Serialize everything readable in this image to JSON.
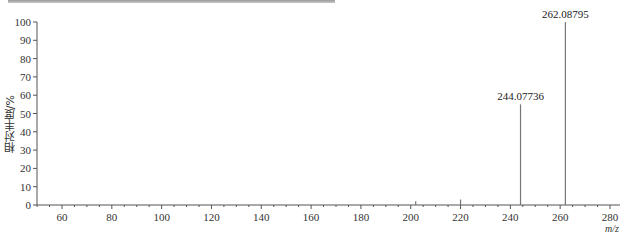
{
  "chart_data": {
    "type": "bar",
    "subtype": "mass-spectrum-stick",
    "title": "",
    "xlabel": "m/z",
    "ylabel": "相对丰度/%",
    "xlim": [
      50,
      284
    ],
    "ylim": [
      0,
      100
    ],
    "x_ticks": [
      60,
      80,
      100,
      120,
      140,
      160,
      180,
      200,
      220,
      240,
      260,
      280
    ],
    "y_ticks": [
      0,
      10,
      20,
      30,
      40,
      50,
      60,
      70,
      80,
      90,
      100
    ],
    "grid": false,
    "legend": null,
    "peaks": [
      {
        "mz": 202.0,
        "intensity": 2,
        "label": ""
      },
      {
        "mz": 220.0,
        "intensity": 3,
        "label": ""
      },
      {
        "mz": 244.07736,
        "intensity": 55,
        "label": "244.07736"
      },
      {
        "mz": 262.08795,
        "intensity": 100,
        "label": "262.08795"
      }
    ]
  },
  "axes": {
    "x_label": "m/z",
    "y_label": "相对丰度/%"
  }
}
